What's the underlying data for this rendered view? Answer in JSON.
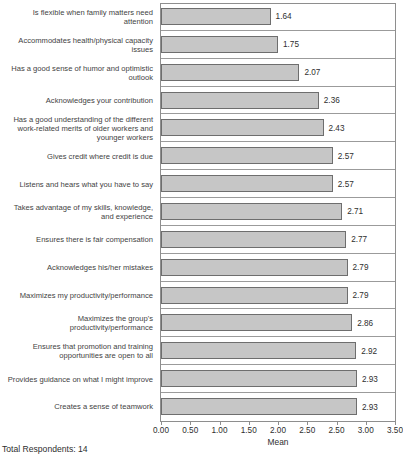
{
  "chart_data": {
    "type": "bar",
    "orientation": "horizontal",
    "title": "",
    "xlabel": "Mean",
    "ylabel": "",
    "xlim": [
      0,
      3.5
    ],
    "grid": "category-separators",
    "legend": "none",
    "bar_color": "#c6c6c6",
    "bar_border_color": "#6e6e6e",
    "categories": [
      "Is flexible when family matters need attention",
      "Accommodates health/physical capacity issues",
      "Has a good sense of humor and optimistic outlook",
      "Acknowledges your contribution",
      "Has a good understanding of the different work-related merits of older workers and younger workers",
      "Gives credit where credit is due",
      "Listens and hears what you have to say",
      "Takes advantage of my skills, knowledge, and experience",
      "Ensures there is fair compensation",
      "Acknowledges his/her mistakes",
      "Maximizes my productivity/performance",
      "Maximizes the group's productivity/performance",
      "Ensures that promotion and training opportunities are open to all",
      "Provides guidance on what I might improve",
      "Creates a sense of teamwork"
    ],
    "category_lines": [
      [
        "Is flexible when family matters need",
        "attention"
      ],
      [
        "Accommodates health/physical capacity",
        "issues"
      ],
      [
        "Has a good sense of humor and optimistic",
        "outlook"
      ],
      [
        "Acknowledges your contribution"
      ],
      [
        "Has a good understanding of the different",
        "work-related merits of older workers and",
        "younger workers"
      ],
      [
        "Gives credit where credit is due"
      ],
      [
        "Listens and hears what you have to say"
      ],
      [
        "Takes advantage of my skills, knowledge,",
        "and experience"
      ],
      [
        "Ensures there is fair compensation"
      ],
      [
        "Acknowledges his/her mistakes"
      ],
      [
        "Maximizes my productivity/performance"
      ],
      [
        "Maximizes the group's",
        "productivity/performance"
      ],
      [
        "Ensures that promotion and training",
        "opportunities are open to all"
      ],
      [
        "Provides guidance on what I might improve"
      ],
      [
        "Creates a sense of teamwork"
      ]
    ],
    "values": [
      1.64,
      1.75,
      2.07,
      2.36,
      2.43,
      2.57,
      2.57,
      2.71,
      2.77,
      2.79,
      2.79,
      2.86,
      2.92,
      2.93,
      2.93
    ],
    "value_labels": [
      "1.64",
      "1.75",
      "2.07",
      "2.36",
      "2.43",
      "2.57",
      "2.57",
      "2.71",
      "2.77",
      "2.79",
      "2.79",
      "2.86",
      "2.92",
      "2.93",
      "2.93"
    ],
    "x_tick_labels": [
      "0.00",
      "0.50",
      "1.00",
      "1.50",
      "2.00",
      "2.50",
      "2.50",
      "3.00",
      "3.50"
    ]
  },
  "footer": {
    "total_respondents": "Total Respondents: 14"
  }
}
